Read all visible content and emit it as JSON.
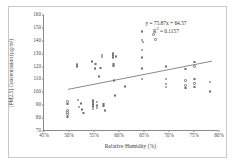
{
  "chart_data": {
    "type": "scatter",
    "title": "",
    "xlabel": "Relative Humidity (%)",
    "ylabel": "[PM2.5] Concentration (µg/m³)",
    "xlim": [
      45,
      80
    ],
    "ylim": [
      70,
      160
    ],
    "xticks": [
      "45%",
      "50%",
      "55%",
      "60%",
      "65%",
      "70%",
      "75%",
      "80%"
    ],
    "xtick_values": [
      45,
      50,
      55,
      60,
      65,
      70,
      75,
      80
    ],
    "yticks": [
      "70",
      "80",
      "90",
      "100",
      "110",
      "120",
      "130",
      "140",
      "150",
      "160"
    ],
    "ytick_values": [
      70,
      80,
      90,
      100,
      110,
      120,
      130,
      140,
      150,
      160
    ],
    "grid": false,
    "legend": false,
    "marker_style": "open-circle",
    "marker_color": "#707070",
    "trendline": {
      "equation": "y = 75.87x + 64.57",
      "r_squared_label": "R² = 0.1157",
      "r_squared_value": 0.1157,
      "slope": 75.87,
      "intercept": 64.57,
      "x_start": 49.8,
      "y_start": 102.3,
      "x_end": 78.6,
      "y_end": 124.2,
      "color": "#6b6b6b"
    },
    "points": [
      {
        "x": 49.7,
        "y": 93.0
      },
      {
        "x": 49.7,
        "y": 91.0
      },
      {
        "x": 49.7,
        "y": 86.0
      },
      {
        "x": 49.7,
        "y": 84.5
      },
      {
        "x": 49.7,
        "y": 83.0
      },
      {
        "x": 49.7,
        "y": 81.0
      },
      {
        "x": 51.6,
        "y": 121.5
      },
      {
        "x": 51.6,
        "y": 120.0
      },
      {
        "x": 51.8,
        "y": 94.0
      },
      {
        "x": 52.4,
        "y": 91.5
      },
      {
        "x": 52.0,
        "y": 88.5
      },
      {
        "x": 52.6,
        "y": 86.5
      },
      {
        "x": 52.9,
        "y": 84.0
      },
      {
        "x": 54.6,
        "y": 124.0
      },
      {
        "x": 55.3,
        "y": 122.0
      },
      {
        "x": 55.2,
        "y": 118.5
      },
      {
        "x": 54.8,
        "y": 93.5
      },
      {
        "x": 54.8,
        "y": 92.0
      },
      {
        "x": 54.8,
        "y": 90.5
      },
      {
        "x": 54.8,
        "y": 89.0
      },
      {
        "x": 54.8,
        "y": 87.0
      },
      {
        "x": 55.6,
        "y": 92.5
      },
      {
        "x": 55.6,
        "y": 90.0
      },
      {
        "x": 55.6,
        "y": 88.0
      },
      {
        "x": 56.6,
        "y": 129.0
      },
      {
        "x": 56.6,
        "y": 127.5
      },
      {
        "x": 56.3,
        "y": 119.0
      },
      {
        "x": 56.0,
        "y": 112.5
      },
      {
        "x": 56.9,
        "y": 91.0
      },
      {
        "x": 56.9,
        "y": 89.5
      },
      {
        "x": 57.2,
        "y": 86.0
      },
      {
        "x": 58.8,
        "y": 130.0
      },
      {
        "x": 58.8,
        "y": 128.5
      },
      {
        "x": 58.8,
        "y": 127.0
      },
      {
        "x": 59.4,
        "y": 128.0
      },
      {
        "x": 58.9,
        "y": 122.0
      },
      {
        "x": 58.9,
        "y": 120.5
      },
      {
        "x": 59.0,
        "y": 109.0
      },
      {
        "x": 59.2,
        "y": 97.5
      },
      {
        "x": 61.2,
        "y": 104.5
      },
      {
        "x": 64.6,
        "y": 147.0
      },
      {
        "x": 64.6,
        "y": 140.5
      },
      {
        "x": 64.8,
        "y": 139.0
      },
      {
        "x": 64.6,
        "y": 133.0
      },
      {
        "x": 64.6,
        "y": 127.0
      },
      {
        "x": 64.6,
        "y": 118.5
      },
      {
        "x": 64.6,
        "y": 110.5
      },
      {
        "x": 66.9,
        "y": 145.0
      },
      {
        "x": 67.3,
        "y": 141.0
      },
      {
        "x": 69.4,
        "y": 120.0
      },
      {
        "x": 69.4,
        "y": 110.5
      },
      {
        "x": 69.4,
        "y": 106.5
      },
      {
        "x": 69.4,
        "y": 104.0
      },
      {
        "x": 73.3,
        "y": 118.0
      },
      {
        "x": 73.3,
        "y": 109.0
      },
      {
        "x": 73.3,
        "y": 105.5
      },
      {
        "x": 73.3,
        "y": 103.5
      },
      {
        "x": 75.1,
        "y": 123.5
      },
      {
        "x": 75.1,
        "y": 120.0
      },
      {
        "x": 75.1,
        "y": 110.5
      },
      {
        "x": 75.1,
        "y": 107.0
      },
      {
        "x": 75.1,
        "y": 104.0
      },
      {
        "x": 78.2,
        "y": 108.0
      },
      {
        "x": 78.2,
        "y": 100.5
      }
    ]
  }
}
